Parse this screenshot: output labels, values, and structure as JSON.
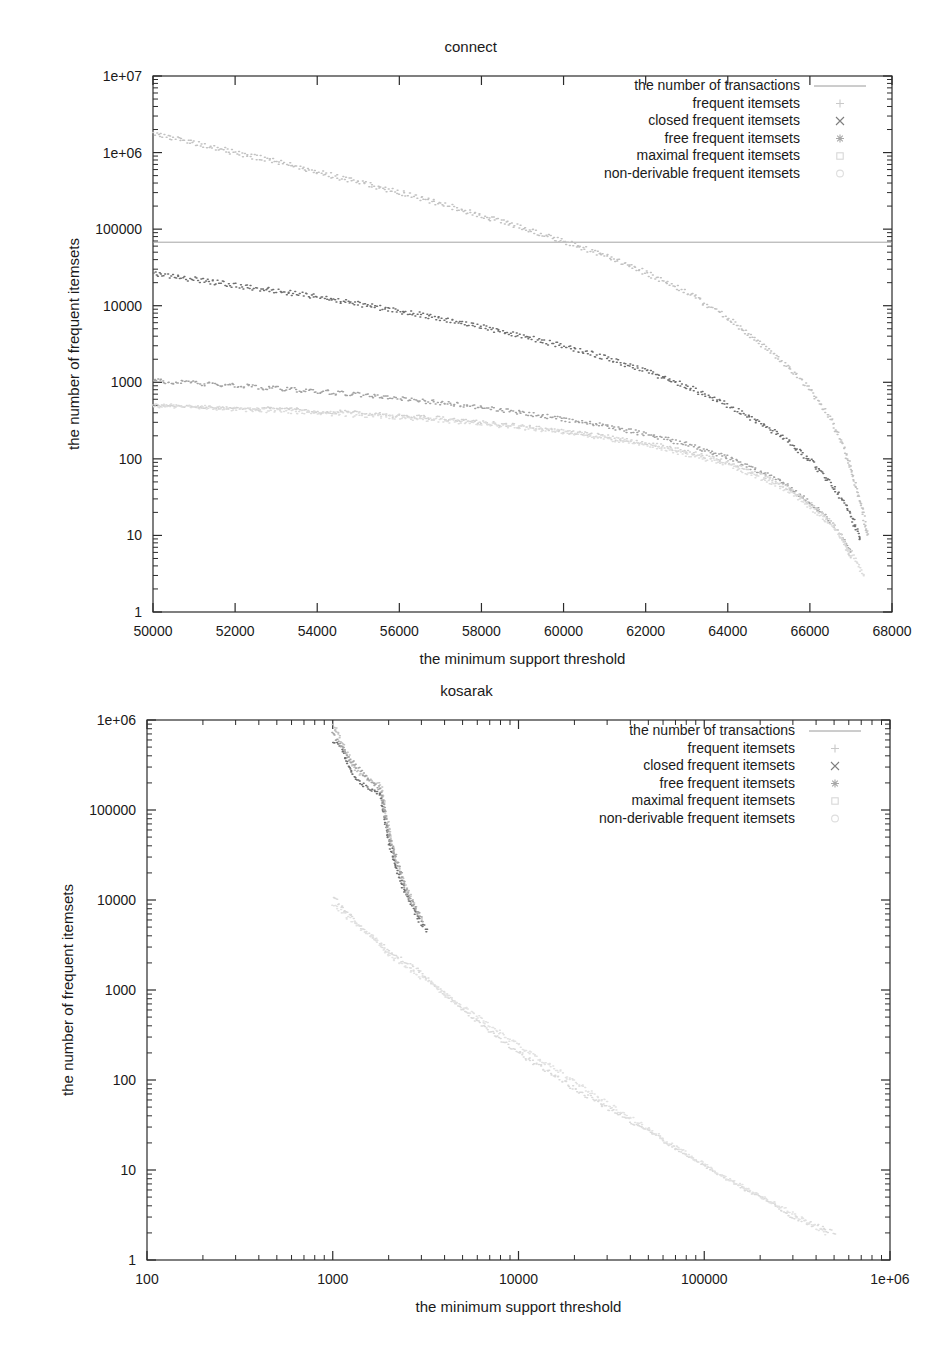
{
  "page": {
    "background": "#ffffff",
    "width": 950,
    "height": 1347
  },
  "charts": [
    {
      "id": "connect",
      "title": "connect",
      "xlabel": "the minimum support threshold",
      "ylabel": "the number of frequent itemsets",
      "legend": [
        {
          "label": "the number of transactions",
          "marker": "line",
          "color": "#9a9a9a"
        },
        {
          "label": "frequent itemsets",
          "marker": "plus",
          "color": "#c9c9c9"
        },
        {
          "label": "closed frequent itemsets",
          "marker": "cross",
          "color": "#7e7e7e"
        },
        {
          "label": "free frequent itemsets",
          "marker": "star",
          "color": "#a8a8a8"
        },
        {
          "label": "maximal frequent itemsets",
          "marker": "square",
          "color": "#d8d8d8"
        },
        {
          "label": "non-derivable frequent itemsets",
          "marker": "circle",
          "color": "#dedede"
        }
      ]
    },
    {
      "id": "kosarak",
      "title": "kosarak",
      "xlabel": "the minimum support threshold",
      "ylabel": "the number of frequent itemsets",
      "legend": [
        {
          "label": "the number of transactions",
          "marker": "line",
          "color": "#9a9a9a"
        },
        {
          "label": "frequent itemsets",
          "marker": "plus",
          "color": "#c9c9c9"
        },
        {
          "label": "closed frequent itemsets",
          "marker": "cross",
          "color": "#7e7e7e"
        },
        {
          "label": "free frequent itemsets",
          "marker": "star",
          "color": "#a8a8a8"
        },
        {
          "label": "maximal frequent itemsets",
          "marker": "square",
          "color": "#d8d8d8"
        },
        {
          "label": "non-derivable frequent itemsets",
          "marker": "circle",
          "color": "#dedede"
        }
      ]
    }
  ],
  "chart_data": [
    {
      "type": "line",
      "id": "connect",
      "title": "connect",
      "xlabel": "the minimum support threshold",
      "ylabel": "the number of frequent itemsets",
      "xscale": "linear",
      "yscale": "log",
      "xlim": [
        50000,
        68000
      ],
      "ylim": [
        1,
        10000000
      ],
      "xticks": [
        50000,
        52000,
        54000,
        56000,
        58000,
        60000,
        62000,
        64000,
        66000,
        68000
      ],
      "xticklabels": [
        "50000",
        "52000",
        "54000",
        "56000",
        "58000",
        "60000",
        "62000",
        "64000",
        "66000",
        "68000"
      ],
      "yticks": [
        1,
        10,
        100,
        1000,
        10000,
        100000,
        1000000,
        10000000
      ],
      "yticklabels": [
        "1",
        "10",
        "100",
        "1000",
        "10000",
        "100000",
        "1e+06",
        "1e+07"
      ],
      "grid": false,
      "legend_position": "top-right",
      "series": [
        {
          "name": "the number of transactions",
          "marker": "line",
          "color": "#9a9a9a",
          "x": [
            50000,
            68000
          ],
          "y": [
            67557,
            67557
          ]
        },
        {
          "name": "frequent itemsets",
          "marker": "plus",
          "color": "#c2c2c2",
          "x": [
            50000,
            51000,
            52000,
            53000,
            54000,
            55000,
            56000,
            57000,
            58000,
            59000,
            60000,
            61000,
            62000,
            63000,
            64000,
            65000,
            65500,
            66000,
            66500,
            66800,
            67000,
            67200,
            67400
          ],
          "y": [
            1800000,
            1350000,
            1000000,
            760000,
            560000,
            410000,
            300000,
            215000,
            150000,
            103000,
            70000,
            45000,
            27000,
            15000,
            7000,
            2600,
            1500,
            800,
            330,
            150,
            70,
            30,
            10
          ]
        },
        {
          "name": "closed frequent itemsets",
          "marker": "cross",
          "color": "#6f6f6f",
          "x": [
            50000,
            51000,
            52000,
            53000,
            54000,
            55000,
            56000,
            57000,
            58000,
            59000,
            60000,
            61000,
            62000,
            63000,
            64000,
            65000,
            65500,
            66000,
            66500,
            66800,
            67000,
            67100,
            67200
          ],
          "y": [
            26000,
            22000,
            18500,
            15500,
            13000,
            10500,
            8500,
            6800,
            5300,
            4000,
            2950,
            2100,
            1400,
            880,
            500,
            250,
            160,
            95,
            48,
            28,
            18,
            13,
            9
          ]
        },
        {
          "name": "free frequent itemsets",
          "marker": "star",
          "color": "#a3a3a3",
          "x": [
            50000,
            51000,
            52000,
            53000,
            54000,
            55000,
            56000,
            57000,
            58000,
            59000,
            60000,
            61000,
            62000,
            63000,
            64000,
            65000,
            65500,
            66000,
            66500,
            66800,
            67000
          ],
          "y": [
            1050,
            980,
            900,
            830,
            760,
            690,
            610,
            540,
            470,
            400,
            330,
            270,
            210,
            155,
            105,
            60,
            42,
            27,
            15,
            9,
            6
          ]
        },
        {
          "name": "maximal frequent itemsets",
          "marker": "square",
          "color": "#d2d2d2",
          "x": [
            50000,
            51000,
            52000,
            53000,
            54000,
            55000,
            56000,
            57000,
            58000,
            59000,
            60000,
            61000,
            62000,
            63000,
            64000,
            65000,
            65500,
            66000,
            66500,
            66800,
            67000
          ],
          "y": [
            520,
            495,
            470,
            445,
            420,
            395,
            365,
            335,
            300,
            265,
            230,
            195,
            160,
            125,
            90,
            55,
            40,
            26,
            15,
            9,
            5
          ]
        },
        {
          "name": "non-derivable frequent itemsets",
          "marker": "circle",
          "color": "#dcdcdc",
          "x": [
            50000,
            52000,
            54000,
            56000,
            58000,
            60000,
            62000,
            64000,
            65500,
            66500,
            67000,
            67300
          ],
          "y": [
            500,
            450,
            400,
            350,
            290,
            225,
            155,
            85,
            38,
            14,
            6,
            3
          ]
        }
      ]
    },
    {
      "type": "line",
      "id": "kosarak",
      "title": "kosarak",
      "xlabel": "the minimum support threshold",
      "ylabel": "the number of frequent itemsets",
      "xscale": "log",
      "yscale": "log",
      "xlim": [
        100,
        1000000
      ],
      "ylim": [
        1,
        1000000
      ],
      "xticks": [
        100,
        1000,
        10000,
        100000,
        1000000
      ],
      "xticklabels": [
        "100",
        "1000",
        "10000",
        "100000",
        "1e+06"
      ],
      "yticks": [
        1,
        10,
        100,
        1000,
        10000,
        100000,
        1000000
      ],
      "yticklabels": [
        "1",
        "10",
        "100",
        "1000",
        "10000",
        "100000",
        "1e+06"
      ],
      "grid": false,
      "legend_position": "top-right",
      "series": [
        {
          "name": "frequent itemsets",
          "marker": "plus",
          "color": "#c2c2c2",
          "x": [
            1000,
            1100,
            1250,
            1400,
            1600,
            1800,
            2000,
            2200,
            2500,
            2800,
            3000
          ],
          "y": [
            900000,
            600000,
            330000,
            250000,
            220000,
            190000,
            60000,
            25000,
            13000,
            8000,
            6000
          ]
        },
        {
          "name": "closed frequent itemsets",
          "marker": "cross",
          "color": "#6f6f6f",
          "x": [
            1000,
            1100,
            1250,
            1400,
            1600,
            1800,
            2000,
            2200,
            2500,
            2800,
            3000,
            3200
          ],
          "y": [
            600000,
            480000,
            260000,
            200000,
            170000,
            150000,
            45000,
            21000,
            11000,
            7000,
            5500,
            4500
          ]
        },
        {
          "name": "free frequent itemsets",
          "marker": "star",
          "color": "#a3a3a3",
          "x": [
            1000,
            1200,
            1500,
            1800,
            2000,
            2500,
            3000
          ],
          "y": [
            700000,
            400000,
            230000,
            170000,
            50000,
            12000,
            6000
          ]
        },
        {
          "name": "maximal frequent itemsets",
          "marker": "square",
          "color": "#dadada",
          "x": [
            1000,
            1200,
            1500,
            1800,
            2000,
            2500,
            3000,
            4000,
            6000,
            10000,
            20000,
            40000,
            80000,
            150000,
            300000,
            500000
          ],
          "y": [
            11000,
            7000,
            4500,
            3300,
            2600,
            2000,
            1500,
            900,
            450,
            200,
            80,
            35,
            15,
            7,
            3,
            2
          ]
        },
        {
          "name": "non-derivable frequent itemsets",
          "marker": "circle",
          "color": "#e2e2e2",
          "x": [
            1000,
            1300,
            1700,
            2000,
            2600,
            3500,
            5000,
            8000,
            15000,
            30000,
            60000,
            120000,
            250000,
            450000
          ],
          "y": [
            9000,
            5500,
            3600,
            2400,
            1700,
            1100,
            650,
            330,
            140,
            55,
            22,
            9,
            4,
            2
          ]
        }
      ]
    }
  ]
}
